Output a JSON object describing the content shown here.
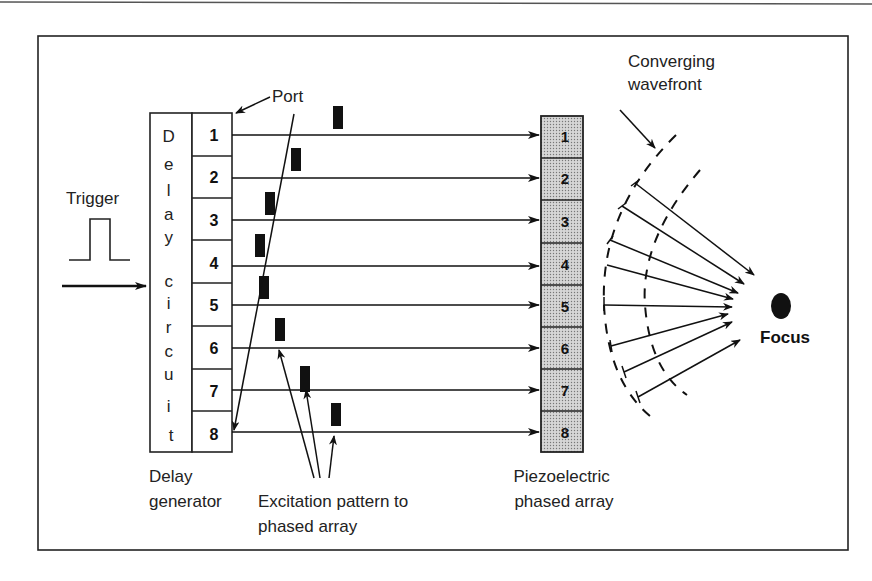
{
  "diagram": {
    "type": "phased-array-focusing-schematic",
    "labels": {
      "trigger": "Trigger",
      "port": "Port",
      "delay_circuit": [
        "D",
        "e",
        "l",
        "a",
        "y",
        "c",
        "i",
        "r",
        "c",
        "u",
        "i",
        "t"
      ],
      "delay_generator_line1": "Delay",
      "delay_generator_line2": "generator",
      "excitation_line1": "Excitation pattern to",
      "excitation_line2": "phased array",
      "piezo_line1": "Piezoelectric",
      "piezo_line2": "phased array",
      "wavefront_line1": "Converging",
      "wavefront_line2": "wavefront",
      "focus": "Focus"
    },
    "ports": [
      "1",
      "2",
      "3",
      "4",
      "5",
      "6",
      "7",
      "8"
    ],
    "elements": [
      "1",
      "2",
      "3",
      "4",
      "5",
      "6",
      "7",
      "8"
    ],
    "pulse_offsets_px": [
      338,
      296,
      270,
      260,
      264,
      280,
      305,
      336
    ],
    "colors": {
      "stroke": "#111111",
      "text": "#222222",
      "array_fill": "#c8c8c8",
      "background": "#ffffff"
    }
  }
}
